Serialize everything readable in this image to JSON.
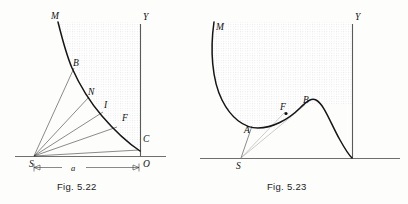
{
  "figure_sheet": {
    "title": "Two geometric optics / mechanics diagrams",
    "background_color": "#fdfdfc",
    "curve_color": "#151515",
    "ray_color": "#2a2a2a",
    "axis_color": "#4a4a4a"
  },
  "figures": [
    {
      "id": "fig-522",
      "caption": "Fig. 5.22",
      "labels": {
        "M": "M",
        "B": "B",
        "N": "N",
        "I": "I",
        "F": "F",
        "C": "C",
        "S": "S",
        "O": "O",
        "Y": "Y",
        "a": "a"
      },
      "points": [
        {
          "name": "M",
          "label": "M",
          "x": 55,
          "y": 18
        },
        {
          "name": "B",
          "label": "B",
          "x": 76,
          "y": 63
        },
        {
          "name": "N",
          "label": "N",
          "x": 91,
          "y": 92
        },
        {
          "name": "I",
          "label": "I",
          "x": 106,
          "y": 105
        },
        {
          "name": "F",
          "label": "F",
          "x": 125,
          "y": 118
        },
        {
          "name": "C",
          "label": "C",
          "x": 145,
          "y": 139
        },
        {
          "name": "S",
          "label": "S",
          "x": 32,
          "y": 165
        },
        {
          "name": "O",
          "label": "O",
          "x": 144,
          "y": 165
        },
        {
          "name": "Y",
          "label": "Y",
          "x": 146,
          "y": 17
        }
      ],
      "dimension": {
        "label": "a",
        "from_point": "S",
        "to_point": "O"
      }
    },
    {
      "id": "fig-523",
      "caption": "Fig. 5.23",
      "labels": {
        "M": "M",
        "A": "A",
        "F": "F",
        "B": "B",
        "S": "S",
        "Y": "Y"
      },
      "points": [
        {
          "name": "M",
          "label": "M",
          "x": 219,
          "y": 28
        },
        {
          "name": "A",
          "label": "A",
          "x": 247,
          "y": 130
        },
        {
          "name": "F",
          "label": "F",
          "x": 285,
          "y": 111
        },
        {
          "name": "B",
          "label": "B",
          "x": 306,
          "y": 105
        },
        {
          "name": "S",
          "label": "S",
          "x": 238,
          "y": 174
        },
        {
          "name": "Y",
          "label": "Y",
          "x": 356,
          "y": 17
        }
      ]
    }
  ]
}
